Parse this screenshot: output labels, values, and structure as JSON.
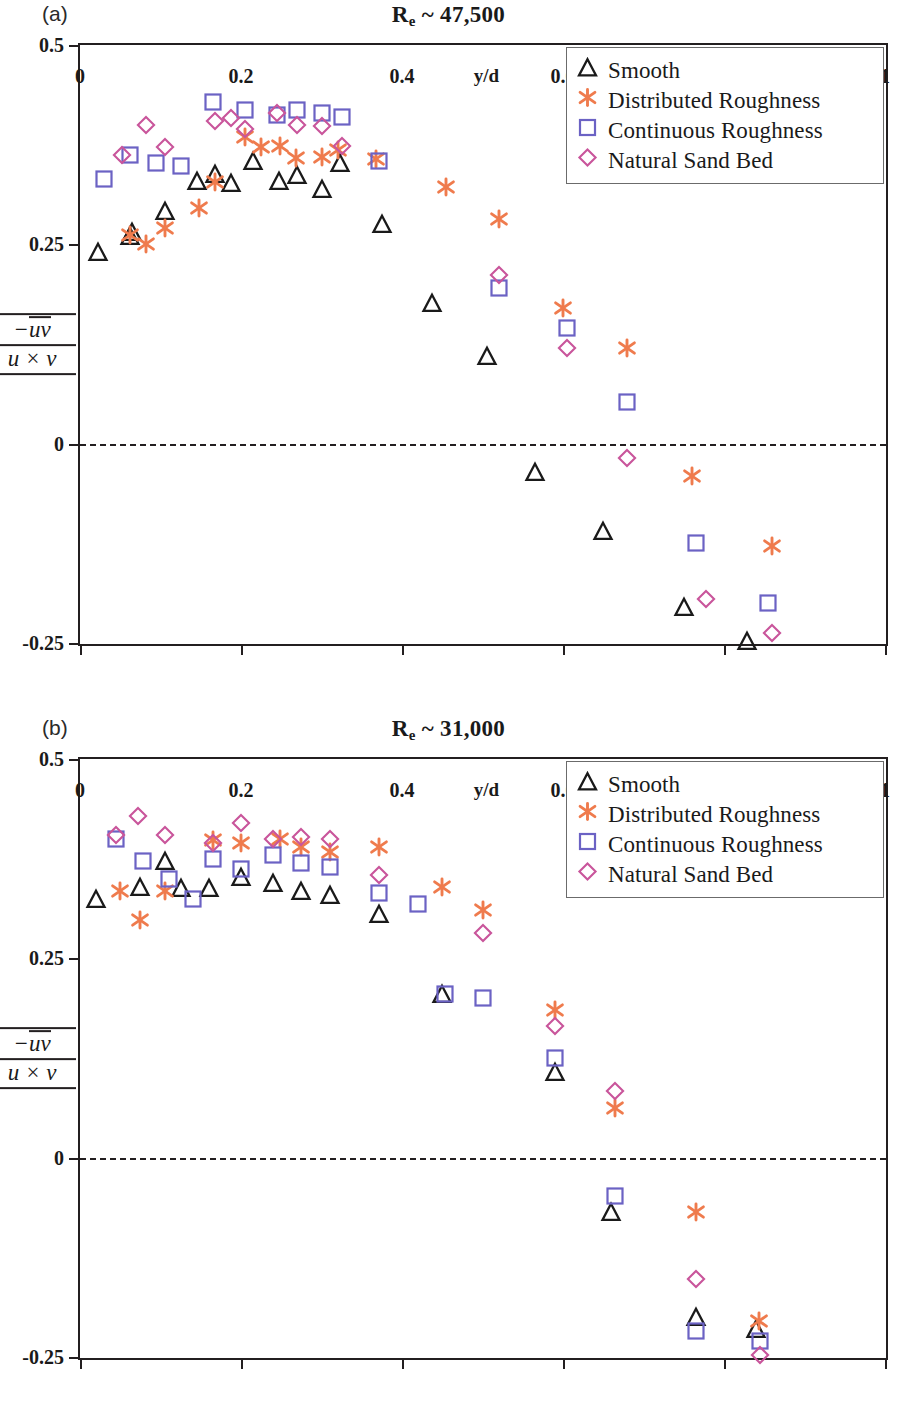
{
  "figure": {
    "panels": [
      {
        "tag": "(a)",
        "title_main": "R",
        "title_sub": "e",
        "title_rest": " ~ 47,500"
      },
      {
        "tag": "(b)",
        "title_main": "R",
        "title_sub": "e",
        "title_rest": " ~ 31,000"
      }
    ],
    "legend": {
      "items": [
        {
          "label": "Smooth",
          "marker": "triangle",
          "color": "#1a1a1a"
        },
        {
          "label": "Distributed Roughness",
          "marker": "asterisk",
          "color": "#ef7b4d"
        },
        {
          "label": "Continuous Roughness",
          "marker": "square",
          "color": "#6b62c4"
        },
        {
          "label": "Natural Sand Bed",
          "marker": "diamond",
          "color": "#c9559b"
        }
      ]
    },
    "yaxis": {
      "numerator": "−uv",
      "denominator": "u × v",
      "ticks": [
        "0.5",
        "0.25",
        "0",
        "-0.25"
      ]
    },
    "xaxis": {
      "title": "y/d",
      "ticks": [
        "0",
        "0.2",
        "0.4",
        "0.6",
        "0.8",
        "1"
      ]
    }
  },
  "chart_data": [
    {
      "type": "scatter",
      "panel": "(a)",
      "title": "Re ~ 47,500",
      "xlabel": "y/d",
      "ylabel": "-uv / (u x v)",
      "xlim": [
        0,
        1
      ],
      "ylim": [
        -0.25,
        0.5
      ],
      "xticks": [
        0,
        0.2,
        0.4,
        0.6,
        0.8,
        1
      ],
      "yticks": [
        -0.25,
        0,
        0.25,
        0.5
      ],
      "grid": false,
      "zero_line": 0,
      "legend_position": "top-right",
      "series": [
        {
          "name": "Smooth",
          "marker": "triangle",
          "color": "#1a1a1a",
          "x": [
            0.022,
            0.062,
            0.064,
            0.105,
            0.145,
            0.168,
            0.188,
            0.215,
            0.247,
            0.27,
            0.3,
            0.323,
            0.375,
            0.437,
            0.505,
            0.565,
            0.65,
            0.75,
            0.828
          ],
          "y": [
            0.24,
            0.26,
            0.265,
            0.292,
            0.33,
            0.338,
            0.327,
            0.355,
            0.33,
            0.337,
            0.32,
            0.352,
            0.275,
            0.176,
            0.11,
            -0.035,
            -0.11,
            -0.205,
            -0.247
          ]
        },
        {
          "name": "Distributed Roughness",
          "marker": "asterisk",
          "color": "#ef7b4d",
          "x": [
            0.062,
            0.082,
            0.105,
            0.148,
            0.168,
            0.205,
            0.225,
            0.248,
            0.268,
            0.3,
            0.32,
            0.368,
            0.455,
            0.52,
            0.6,
            0.68,
            0.76,
            0.86
          ],
          "y": [
            0.262,
            0.25,
            0.27,
            0.295,
            0.328,
            0.385,
            0.372,
            0.373,
            0.358,
            0.36,
            0.368,
            0.357,
            0.322,
            0.282,
            0.17,
            0.12,
            -0.04,
            -0.128
          ]
        },
        {
          "name": "Continuous Roughness",
          "marker": "square",
          "color": "#6b62c4",
          "x": [
            0.03,
            0.062,
            0.095,
            0.125,
            0.165,
            0.205,
            0.245,
            0.27,
            0.3,
            0.325,
            0.372,
            0.52,
            0.605,
            0.68,
            0.765,
            0.855
          ],
          "y": [
            0.332,
            0.362,
            0.352,
            0.348,
            0.428,
            0.418,
            0.412,
            0.418,
            0.415,
            0.41,
            0.355,
            0.195,
            0.145,
            0.052,
            -0.125,
            -0.2
          ]
        },
        {
          "name": "Natural Sand Bed",
          "marker": "diamond",
          "color": "#c9559b",
          "x": [
            0.052,
            0.082,
            0.105,
            0.168,
            0.188,
            0.205,
            0.245,
            0.27,
            0.3,
            0.325,
            0.52,
            0.605,
            0.68,
            0.778,
            0.86
          ],
          "y": [
            0.362,
            0.4,
            0.372,
            0.405,
            0.408,
            0.395,
            0.415,
            0.4,
            0.398,
            0.373,
            0.212,
            0.12,
            -0.018,
            -0.195,
            -0.238
          ]
        }
      ]
    },
    {
      "type": "scatter",
      "panel": "(b)",
      "title": "Re ~ 31,000",
      "xlabel": "y/d",
      "ylabel": "-uv / (u x v)",
      "xlim": [
        0,
        1
      ],
      "ylim": [
        -0.25,
        0.5
      ],
      "xticks": [
        0,
        0.2,
        0.4,
        0.6,
        0.8,
        1
      ],
      "yticks": [
        -0.25,
        0,
        0.25,
        0.5
      ],
      "grid": false,
      "zero_line": 0,
      "legend_position": "top-right",
      "series": [
        {
          "name": "Smooth",
          "marker": "triangle",
          "color": "#1a1a1a",
          "x": [
            0.02,
            0.075,
            0.105,
            0.125,
            0.16,
            0.2,
            0.24,
            0.275,
            0.31,
            0.372,
            0.45,
            0.59,
            0.66,
            0.765,
            0.84
          ],
          "y": [
            0.325,
            0.34,
            0.372,
            0.338,
            0.338,
            0.352,
            0.345,
            0.335,
            0.33,
            0.305,
            0.205,
            0.108,
            -0.068,
            -0.2,
            -0.215
          ]
        },
        {
          "name": "Distributed Roughness",
          "marker": "asterisk",
          "color": "#ef7b4d",
          "x": [
            0.05,
            0.075,
            0.105,
            0.165,
            0.2,
            0.248,
            0.275,
            0.31,
            0.372,
            0.45,
            0.5,
            0.59,
            0.665,
            0.765,
            0.843
          ],
          "y": [
            0.335,
            0.298,
            0.335,
            0.398,
            0.395,
            0.4,
            0.39,
            0.383,
            0.39,
            0.34,
            0.31,
            0.185,
            0.062,
            -0.068,
            -0.205
          ]
        },
        {
          "name": "Continuous Roughness",
          "marker": "square",
          "color": "#6b62c4",
          "x": [
            0.045,
            0.078,
            0.11,
            0.14,
            0.165,
            0.2,
            0.24,
            0.275,
            0.31,
            0.372,
            0.42,
            0.453,
            0.5,
            0.59,
            0.665,
            0.765,
            0.845
          ],
          "y": [
            0.4,
            0.372,
            0.35,
            0.325,
            0.375,
            0.362,
            0.38,
            0.37,
            0.365,
            0.332,
            0.318,
            0.205,
            0.2,
            0.125,
            -0.048,
            -0.218,
            -0.23
          ]
        },
        {
          "name": "Natural Sand Bed",
          "marker": "diamond",
          "color": "#c9559b",
          "x": [
            0.045,
            0.072,
            0.105,
            0.165,
            0.2,
            0.24,
            0.275,
            0.31,
            0.372,
            0.5,
            0.59,
            0.665,
            0.765,
            0.845
          ],
          "y": [
            0.405,
            0.428,
            0.405,
            0.395,
            0.42,
            0.4,
            0.402,
            0.4,
            0.355,
            0.282,
            0.165,
            0.083,
            -0.152,
            -0.248
          ]
        }
      ]
    }
  ]
}
